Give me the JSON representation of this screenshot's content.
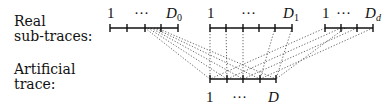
{
  "labels": {
    "real_line1": "Real",
    "real_line2": "sub-traces:",
    "artificial_line1": "Artificial",
    "artificial_line2": "trace:"
  },
  "real_traces": [
    {
      "start_label": "1",
      "dots": "···",
      "end_label": "D",
      "end_sub": "0"
    },
    {
      "start_label": "1",
      "dots": "···",
      "end_label": "D",
      "end_sub": "1"
    },
    {
      "start_label": "1",
      "dots": "···",
      "end_label": "D",
      "end_sub": "d"
    }
  ],
  "artificial_trace": {
    "start_label": "1",
    "dots": "···",
    "end_label": "D"
  },
  "colors": {
    "ink": "#111111",
    "dotted": "#555555"
  }
}
